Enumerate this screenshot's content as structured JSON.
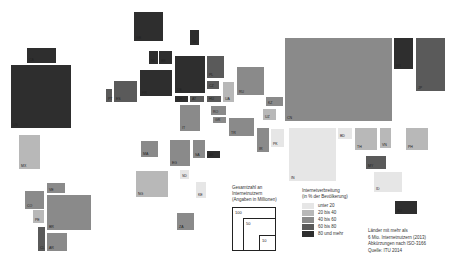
{
  "chart_data": {
    "type": "treemap-cartogram",
    "title": "",
    "size_legend": {
      "title_lines": [
        "Gesamtzahl an",
        "Internetnutzern",
        "(Angaben in Millionen)"
      ],
      "values": [
        "100",
        "50",
        "10"
      ]
    },
    "color_legend": {
      "title_lines": [
        "Internetverbreitung",
        "(in % der Bevölkerung)"
      ],
      "classes": [
        {
          "label": "unter  20",
          "color": "#e6e6e6"
        },
        {
          "label": "20 bis  40",
          "color": "#b8b8b8"
        },
        {
          "label": "40 bis  60",
          "color": "#8a8a8a"
        },
        {
          "label": "60 bis  80",
          "color": "#5a5a5a"
        },
        {
          "label": "80 und mehr",
          "color": "#2e2e2e"
        }
      ]
    },
    "notes": [
      "Länder mit mehr als",
      "6 Mio. Internetnutzern (2013)",
      "Abkürzungen nach ISO-3166",
      "Quelle: ITU 2014"
    ],
    "countries": [
      {
        "code": "CA",
        "x": 26,
        "y": 47,
        "w": 31,
        "h": 17,
        "cls": 5
      },
      {
        "code": "US",
        "x": 10,
        "y": 64,
        "w": 62,
        "h": 65,
        "cls": 5
      },
      {
        "code": "MX",
        "x": 18,
        "y": 134,
        "w": 23,
        "h": 36,
        "cls": 2
      },
      {
        "code": "VE",
        "x": 46,
        "y": 182,
        "w": 20,
        "h": 12,
        "cls": 3
      },
      {
        "code": "CO",
        "x": 24,
        "y": 190,
        "w": 21,
        "h": 20,
        "cls": 3
      },
      {
        "code": "PE",
        "x": 32,
        "y": 209,
        "w": 13,
        "h": 15,
        "cls": 2
      },
      {
        "code": "BR",
        "x": 46,
        "y": 194,
        "w": 46,
        "h": 37,
        "cls": 3
      },
      {
        "code": "CL",
        "x": 37,
        "y": 226,
        "w": 9,
        "h": 26,
        "cls": 4
      },
      {
        "code": "AR",
        "x": 46,
        "y": 232,
        "w": 22,
        "h": 20,
        "cls": 3
      },
      {
        "code": "GB",
        "x": 133,
        "y": 11,
        "w": 31,
        "h": 31,
        "cls": 5
      },
      {
        "code": "SE",
        "x": 189,
        "y": 29,
        "w": 11,
        "h": 17,
        "cls": 5
      },
      {
        "code": "NL",
        "x": 148,
        "y": 50,
        "w": 11,
        "h": 15,
        "cls": 5
      },
      {
        "code": "BE",
        "x": 158,
        "y": 50,
        "w": 15,
        "h": 15,
        "cls": 5
      },
      {
        "code": "PT",
        "x": 105,
        "y": 88,
        "w": 8,
        "h": 15,
        "cls": 4
      },
      {
        "code": "ES",
        "x": 113,
        "y": 80,
        "w": 25,
        "h": 23,
        "cls": 4
      },
      {
        "code": "FR",
        "x": 139,
        "y": 69,
        "w": 34,
        "h": 28,
        "cls": 5
      },
      {
        "code": "DE",
        "x": 174,
        "y": 55,
        "w": 32,
        "h": 39,
        "cls": 5
      },
      {
        "code": "PL",
        "x": 206,
        "y": 55,
        "w": 19,
        "h": 24,
        "cls": 4
      },
      {
        "code": "CZ",
        "x": 206,
        "y": 80,
        "w": 14,
        "h": 10,
        "cls": 4
      },
      {
        "code": "UA",
        "x": 222,
        "y": 81,
        "w": 13,
        "h": 22,
        "cls": 2
      },
      {
        "code": "RU",
        "x": 236,
        "y": 66,
        "w": 29,
        "h": 30,
        "cls": 3
      },
      {
        "code": "CH",
        "x": 174,
        "y": 95,
        "w": 15,
        "h": 8,
        "cls": 5
      },
      {
        "code": "AT",
        "x": 189,
        "y": 95,
        "w": 16,
        "h": 8,
        "cls": 4
      },
      {
        "code": "HU",
        "x": 206,
        "y": 95,
        "w": 16,
        "h": 8,
        "cls": 4
      },
      {
        "code": "IT",
        "x": 179,
        "y": 104,
        "w": 22,
        "h": 28,
        "cls": 3
      },
      {
        "code": "RO",
        "x": 210,
        "y": 105,
        "w": 17,
        "h": 11,
        "cls": 3
      },
      {
        "code": "GR",
        "x": 212,
        "y": 116,
        "w": 15,
        "h": 8,
        "cls": 3
      },
      {
        "code": "TR",
        "x": 228,
        "y": 117,
        "w": 27,
        "h": 20,
        "cls": 3
      },
      {
        "code": "KZ",
        "x": 265,
        "y": 96,
        "w": 19,
        "h": 11,
        "cls": 3
      },
      {
        "code": "UZ",
        "x": 262,
        "y": 108,
        "w": 15,
        "h": 13,
        "cls": 2
      },
      {
        "code": "IR",
        "x": 256,
        "y": 127,
        "w": 14,
        "h": 26,
        "cls": 3
      },
      {
        "code": "PK",
        "x": 270,
        "y": 128,
        "w": 15,
        "h": 20,
        "cls": 1
      },
      {
        "code": "CN",
        "x": 284,
        "y": 37,
        "w": 109,
        "h": 85,
        "cls": 3
      },
      {
        "code": "KR",
        "x": 393,
        "y": 37,
        "w": 21,
        "h": 33,
        "cls": 5
      },
      {
        "code": "JP",
        "x": 415,
        "y": 37,
        "w": 31,
        "h": 55,
        "cls": 4
      },
      {
        "code": "IN",
        "x": 288,
        "y": 127,
        "w": 49,
        "h": 55,
        "cls": 1
      },
      {
        "code": "BD",
        "x": 337,
        "y": 127,
        "w": 16,
        "h": 13,
        "cls": 1
      },
      {
        "code": "TH",
        "x": 354,
        "y": 127,
        "w": 24,
        "h": 24,
        "cls": 2
      },
      {
        "code": "VN",
        "x": 379,
        "y": 127,
        "w": 13,
        "h": 22,
        "cls": 2
      },
      {
        "code": "PH",
        "x": 405,
        "y": 127,
        "w": 24,
        "h": 24,
        "cls": 2
      },
      {
        "code": "MY",
        "x": 365,
        "y": 155,
        "w": 22,
        "h": 15,
        "cls": 4
      },
      {
        "code": "ID",
        "x": 373,
        "y": 171,
        "w": 30,
        "h": 22,
        "cls": 1
      },
      {
        "code": "AU",
        "x": 394,
        "y": 200,
        "w": 24,
        "h": 15,
        "cls": 5
      },
      {
        "code": "MA",
        "x": 140,
        "y": 140,
        "w": 19,
        "h": 18,
        "cls": 3
      },
      {
        "code": "EG",
        "x": 169,
        "y": 139,
        "w": 22,
        "h": 28,
        "cls": 3
      },
      {
        "code": "SA",
        "x": 192,
        "y": 139,
        "w": 14,
        "h": 20,
        "cls": 3
      },
      {
        "code": "AE",
        "x": 206,
        "y": 150,
        "w": 15,
        "h": 9,
        "cls": 5
      },
      {
        "code": "NG",
        "x": 135,
        "y": 170,
        "w": 34,
        "h": 28,
        "cls": 2
      },
      {
        "code": "SD",
        "x": 179,
        "y": 169,
        "w": 11,
        "h": 11,
        "cls": 1
      },
      {
        "code": "KE",
        "x": 195,
        "y": 181,
        "w": 12,
        "h": 18,
        "cls": 1
      },
      {
        "code": "ZA",
        "x": 176,
        "y": 212,
        "w": 19,
        "h": 19,
        "cls": 3
      }
    ]
  }
}
